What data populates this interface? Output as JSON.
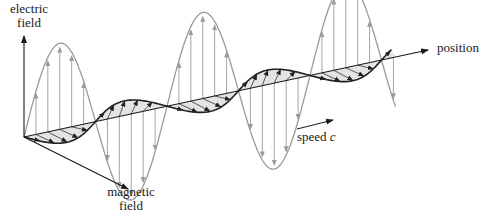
{
  "labels": {
    "electric_axis": [
      "electric",
      "field"
    ],
    "magnetic_axis": [
      "magnetic",
      "field"
    ],
    "position_axis": "position",
    "speed": {
      "text": "speed",
      "symbol": "c"
    }
  },
  "colors": {
    "axis": "#1a1a1a",
    "electric_wave": "#9a9a9a",
    "electric_arrows": "#9a9a9a",
    "magnetic_wave": "#222222",
    "magnetic_fill": "#e4e4e4",
    "magnetic_arrows": "#333333",
    "background": "#ffffff"
  },
  "geometry": {
    "origin": [
      24,
      137
    ],
    "position_axis_end": [
      428,
      50
    ],
    "electric_axis_end": [
      24,
      36
    ],
    "magnetic_axis_end": [
      128,
      189
    ],
    "half_wavelengths": 5.2,
    "half_wavelength_px": 71.5,
    "electric_amplitude": 86,
    "magnetic_offset": [
      7,
      13
    ],
    "arrows_per_half_wave": 5,
    "speed_arrow": [
      [
        297,
        129
      ],
      [
        333,
        120
      ]
    ]
  }
}
